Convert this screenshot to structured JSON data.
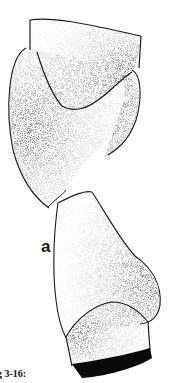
{
  "figure": {
    "label": "a",
    "caption": "g 3-16:",
    "ink_color": "#1a1a1a",
    "background_color": "#ffffff"
  }
}
